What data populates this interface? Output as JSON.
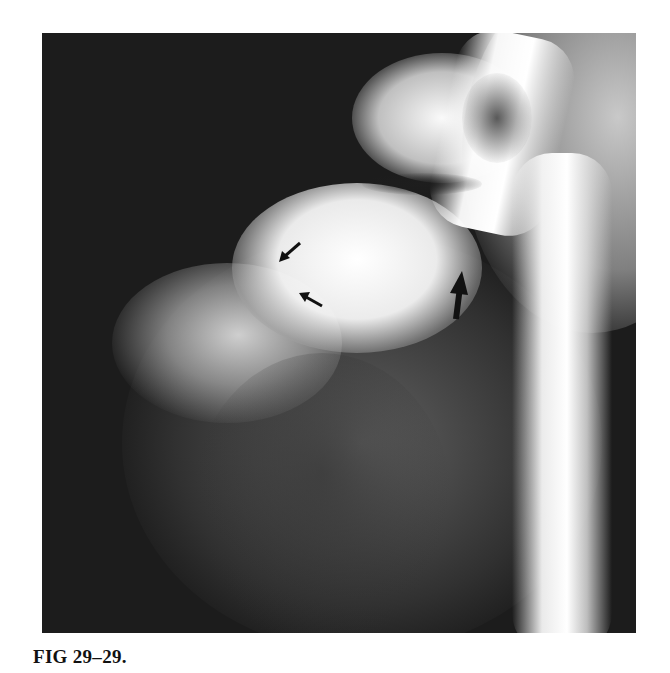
{
  "figure": {
    "label": "FIG 29–29.",
    "image_description": "Angiogram (grayscale radiograph) showing contrast-filled vessels with a tall bright aortic column on the right",
    "annotations": [
      {
        "type": "arrow",
        "size": "small",
        "direction": "down-left"
      },
      {
        "type": "arrow",
        "size": "small",
        "direction": "up-left"
      },
      {
        "type": "arrow",
        "size": "large",
        "direction": "up"
      }
    ]
  }
}
